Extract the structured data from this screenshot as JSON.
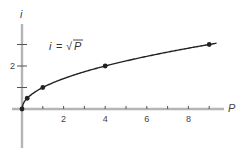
{
  "chart_data": {
    "type": "line",
    "title": "",
    "annotation": "i = √P",
    "xlabel": "P",
    "ylabel": "i",
    "x": [
      0,
      0.25,
      1,
      4,
      9
    ],
    "series": [
      {
        "name": "i = √P",
        "values": [
          0,
          0.5,
          1,
          2,
          3
        ]
      }
    ],
    "xticks": [
      1,
      2,
      3,
      4,
      5,
      6,
      7,
      8,
      9
    ],
    "xtick_labels": [
      "2",
      "4",
      "6",
      "8"
    ],
    "yticks": [
      1,
      2,
      3
    ],
    "ytick_labels": [
      "2"
    ],
    "xlim": [
      -0.5,
      9.8
    ],
    "ylim": [
      -1.8,
      4
    ],
    "grid": false,
    "legend": "none"
  },
  "labels": {
    "x_axis": "P",
    "y_axis": "i",
    "equation_lhs": "i",
    "equation_eq": "=",
    "equation_rhs": "P",
    "tick_2": "2",
    "tick_4": "4",
    "tick_6": "6",
    "tick_8": "8",
    "ytick_2": "2"
  }
}
